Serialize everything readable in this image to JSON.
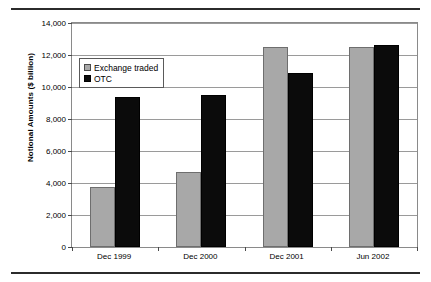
{
  "chart_data": {
    "type": "bar",
    "title": "",
    "xlabel": "",
    "ylabel": "Notional Amounts ($ billion)",
    "categories": [
      "Dec 1999",
      "Dec 2000",
      "Dec 2001",
      "Jun 2002"
    ],
    "series": [
      {
        "name": "Exchange traded",
        "color": "#a8a8a8",
        "values": [
          3750,
          4700,
          12500,
          12500
        ]
      },
      {
        "name": "OTC",
        "color": "#0b0b0b",
        "values": [
          9400,
          9500,
          10900,
          12600
        ]
      }
    ],
    "ylim": [
      0,
      14000
    ],
    "yticks": [
      0,
      2000,
      4000,
      6000,
      8000,
      10000,
      12000,
      14000
    ],
    "ytick_labels": [
      "0",
      "2,000",
      "4,000",
      "6,000",
      "8,000",
      "10,000",
      "12,000",
      "14,000"
    ],
    "grid": true,
    "legend_position": "upper-left",
    "legend_entries": [
      "Exchange traded",
      "OTC"
    ]
  }
}
